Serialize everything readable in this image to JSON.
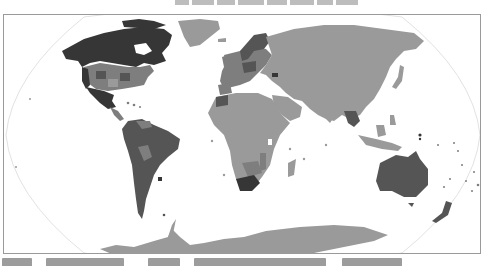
{
  "map": {
    "projection": "Robinson",
    "style": "grayscale choropleth world map",
    "legend": null,
    "colors": {
      "ocean": "#ffffff",
      "graticule_outline": "#e2e2e2",
      "frame_border": "#9a9a9a",
      "level_darkest": "#363636",
      "level_dark": "#555555",
      "level_medium": "#7e7e7e",
      "level_light": "#9a9a9a",
      "level_lightest": "#b2b2b2"
    },
    "regions": [
      {
        "name": "Canada",
        "shade": "level_darkest"
      },
      {
        "name": "Alaska",
        "shade": "level_darkest"
      },
      {
        "name": "Greenland",
        "shade": "level_light"
      },
      {
        "name": "United States (mixed states)",
        "shade": "level_medium"
      },
      {
        "name": "Mexico",
        "shade": "level_darkest"
      },
      {
        "name": "Central America",
        "shade": "level_medium"
      },
      {
        "name": "South America",
        "shade": "level_dark"
      },
      {
        "name": "Uruguay",
        "shade": "level_darkest"
      },
      {
        "name": "Europe",
        "shade": "level_medium"
      },
      {
        "name": "Scandinavia",
        "shade": "level_dark"
      },
      {
        "name": "Russia / Asia",
        "shade": "level_light"
      },
      {
        "name": "Africa",
        "shade": "level_light"
      },
      {
        "name": "Southern Africa",
        "shade": "level_medium"
      },
      {
        "name": "South Africa",
        "shade": "level_darkest"
      },
      {
        "name": "Southeast Asia",
        "shade": "level_dark"
      },
      {
        "name": "Australia",
        "shade": "level_dark"
      },
      {
        "name": "New Zealand",
        "shade": "level_dark"
      },
      {
        "name": "Antarctica",
        "shade": "level_light"
      }
    ]
  },
  "title": {
    "visible": "partial",
    "text_cut_off": true
  },
  "caption": {
    "visible": "partial",
    "text_cut_off": true
  }
}
